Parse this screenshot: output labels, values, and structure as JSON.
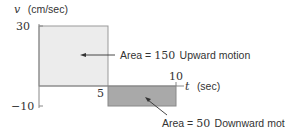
{
  "diagram": {
    "y_axis": {
      "symbol": "v",
      "unit": "(cm/sec)",
      "ticks": [
        "30",
        "−10"
      ]
    },
    "x_axis": {
      "symbol": "t",
      "unit": "(sec)",
      "ticks": [
        "5",
        "10"
      ]
    },
    "regions": [
      {
        "name": "upward",
        "t_start": 0,
        "t_end": 5,
        "v": 30,
        "fill": "#ececec",
        "label_prefix": "Area = ",
        "area": "150",
        "label_suffix": " Upward motion"
      },
      {
        "name": "downward",
        "t_start": 5,
        "t_end": 10,
        "v": -10,
        "fill": "#a9a9a9",
        "label_prefix": "Area = ",
        "area": "50",
        "label_suffix": " Downward motion"
      }
    ],
    "colors": {
      "axis": "#888888",
      "arrow": "#333333",
      "text": "#333333"
    }
  }
}
